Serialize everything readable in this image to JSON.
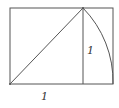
{
  "diagram": {
    "labels": {
      "vertical_side": "1",
      "horizontal_side": "1"
    },
    "colors": {
      "stroke": "#555555",
      "background": "#ffffff",
      "label": "#333333"
    },
    "geometry": {
      "rect": {
        "x1": 10,
        "y1": 8,
        "x2": 113,
        "y2": 84
      },
      "square_right_x": 83,
      "diagonal": {
        "from": [
          10,
          84
        ],
        "to": [
          83,
          8
        ]
      },
      "arc": {
        "center": [
          10,
          84
        ],
        "from": [
          83,
          8
        ],
        "to": [
          113,
          84
        ]
      }
    }
  }
}
